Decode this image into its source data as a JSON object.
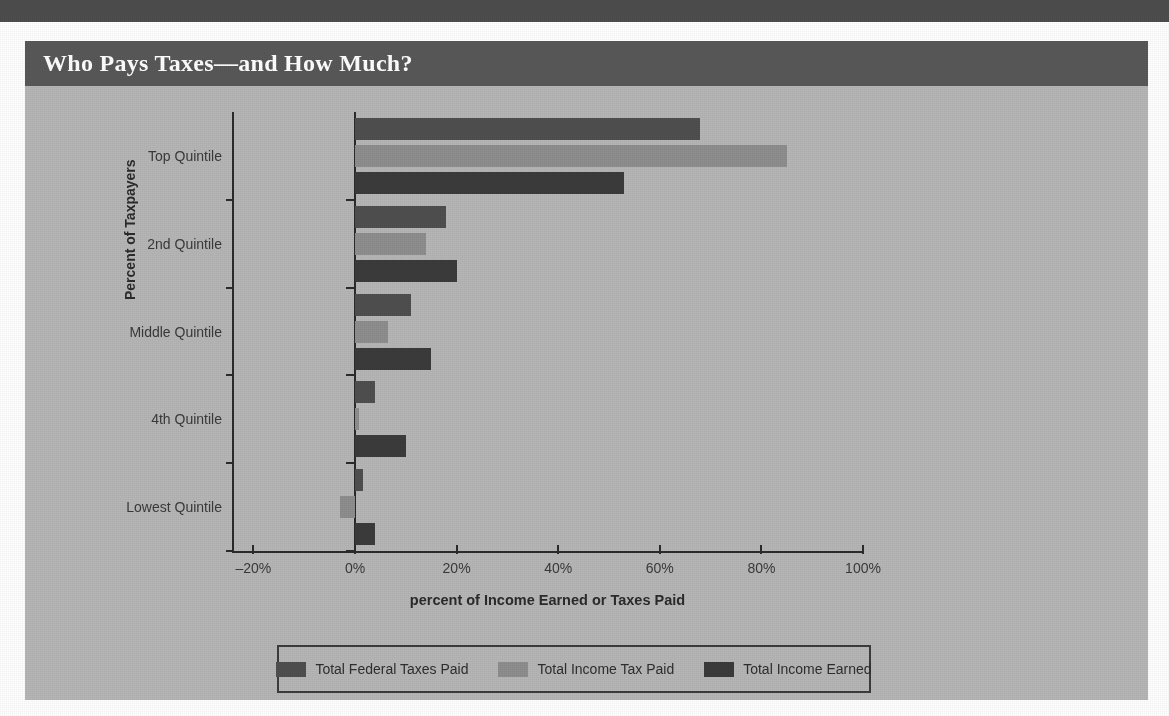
{
  "figure": {
    "title": "Who Pays Taxes—and How Much?"
  },
  "chart_data": {
    "type": "bar",
    "orientation": "horizontal",
    "title": "Who Pays Taxes—and How Much?",
    "xlabel": "percent of Income Earned or Taxes Paid",
    "ylabel": "Percent of Taxpayers",
    "xlim": [
      -20,
      100
    ],
    "xticks": [
      -20,
      0,
      20,
      40,
      60,
      80,
      100
    ],
    "xtick_labels": [
      "–20%",
      "0%",
      "20%",
      "40%",
      "60%",
      "80%",
      "100%"
    ],
    "grid": false,
    "legend_position": "bottom",
    "categories": [
      "Top Quintile",
      "2nd Quintile",
      "Middle Quintile",
      "4th Quintile",
      "Lowest Quintile"
    ],
    "series": [
      {
        "name": "Total Federal Taxes Paid",
        "color": "#4f4f4f",
        "values": [
          68.0,
          18.0,
          11.0,
          4.0,
          1.5
        ]
      },
      {
        "name": "Total Income Tax Paid",
        "color": "#8e8e8e",
        "values": [
          85.0,
          14.0,
          6.5,
          0.8,
          -3.0
        ]
      },
      {
        "name": "Total Income Earned",
        "color": "#3b3b3b",
        "values": [
          53.0,
          20.0,
          15.0,
          10.0,
          4.0
        ]
      }
    ]
  },
  "colors": {
    "panel_background": "#b6b6b6",
    "title_bar": "#585858",
    "top_band": "#4d4d4d",
    "axis": "#2b2b2b",
    "title_text": "#ffffff"
  }
}
